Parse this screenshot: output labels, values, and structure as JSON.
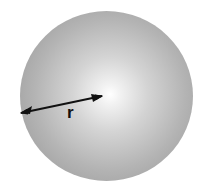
{
  "diagram": {
    "shading": "radial gradient, bright center highlight fading to gray edge",
    "colors": {
      "background": "#ffffff",
      "sphere_center": "#ffffff",
      "sphere_edge": "#999999",
      "arrow": "#111111",
      "label": "#111111"
    },
    "radius_arrow": {
      "style": "double-headed",
      "from": [
        20,
        113
      ],
      "to": [
        103,
        96
      ]
    },
    "labels": {
      "radius": "r"
    }
  }
}
